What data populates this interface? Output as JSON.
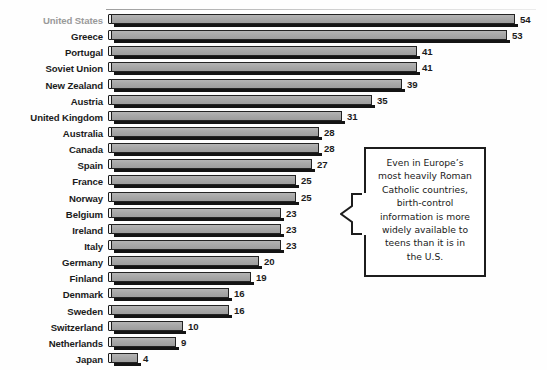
{
  "chart_data": {
    "type": "bar",
    "orientation": "horizontal",
    "title": "",
    "subtitle": "",
    "xlabel": "",
    "ylabel": "",
    "grid": false,
    "legend": null,
    "xlim": [
      0,
      54
    ],
    "value_labels_shown": true,
    "categories": [
      "United States",
      "Greece",
      "Portugal",
      "Soviet Union",
      "New Zealand",
      "Austria",
      "United Kingdom",
      "Australia",
      "Canada",
      "Spain",
      "France",
      "Norway",
      "Belgium",
      "Ireland",
      "Italy",
      "Germany",
      "Finland",
      "Denmark",
      "Sweden",
      "Switzerland",
      "Netherlands",
      "Japan"
    ],
    "values": [
      54,
      53,
      41,
      41,
      39,
      35,
      31,
      28,
      28,
      27,
      25,
      25,
      23,
      23,
      23,
      20,
      19,
      16,
      16,
      10,
      9,
      4
    ],
    "highlighted_category": "United States",
    "annotations": [
      {
        "name": "europe-callout",
        "text": "Even in Europe’s most heavily Roman Catholic countries, birth-control information is more widely available to teens than it is in the U.S.",
        "lines": [
          "Even in Europe’s",
          "most heavily Roman",
          "Catholic countries,",
          "birth-control",
          "information is more",
          "widely available to",
          "teens than it is in",
          "the U.S."
        ]
      }
    ]
  },
  "style": {
    "background": "#fefefe",
    "bar_fill": "#a8a8a8",
    "bar_outline": "#232323",
    "bar_shadow": "#141414",
    "label_color": "#1b1b1b",
    "muted_label_color": "#9a9a9a",
    "callout_border": "#1d1d1d"
  }
}
